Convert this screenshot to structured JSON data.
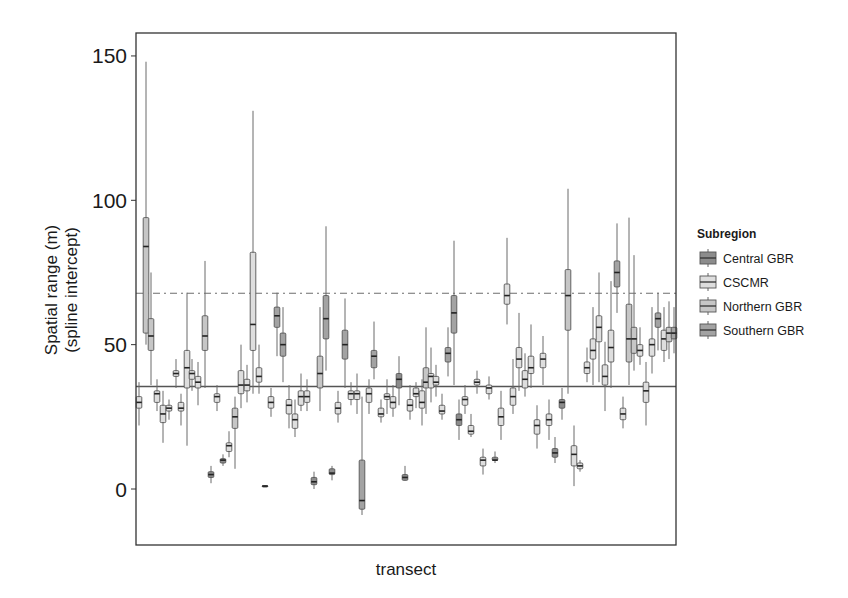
{
  "chart_data": {
    "type": "boxplot",
    "title": "",
    "xlabel": "transect",
    "ylabel": "Spatial range (m)\n(spline intercept)",
    "ylabel_lines": [
      "Spatial range (m)",
      "(spline intercept)"
    ],
    "ylim": [
      -18,
      158
    ],
    "yticks": [
      0,
      50,
      100,
      150
    ],
    "ytick_labels": [
      "0",
      "50",
      "100",
      "150"
    ],
    "xticks": [],
    "grid": false,
    "legend": {
      "title": "Subregion",
      "position": "right",
      "entries": [
        {
          "key": "central",
          "label": "Central GBR",
          "color": "#8c8c8c"
        },
        {
          "key": "cscmr",
          "label": "CSCMR",
          "color": "#dedede"
        },
        {
          "key": "northern",
          "label": "Northern GBR",
          "color": "#c6c6c6"
        },
        {
          "key": "southern",
          "label": "Southern GBR",
          "color": "#a3a3a3"
        }
      ]
    },
    "reference_lines": [
      {
        "style": "solid",
        "y": 35.5,
        "color": "#555555"
      },
      {
        "style": "dash-dot",
        "y": 67.8,
        "color": "#6e6e6e"
      }
    ],
    "boxes": [
      {
        "x": 139,
        "group": "cscmr",
        "min": 22,
        "q1": 28,
        "med": 30,
        "q3": 32,
        "max": 37
      },
      {
        "x": 146,
        "group": "northern",
        "min": 50,
        "q1": 54,
        "med": 84,
        "q3": 94,
        "max": 148
      },
      {
        "x": 151,
        "group": "northern",
        "min": 36,
        "q1": 48,
        "med": 53,
        "q3": 59,
        "max": 75
      },
      {
        "x": 157,
        "group": "cscmr",
        "min": 27,
        "q1": 30,
        "med": 33,
        "q3": 34,
        "max": 38
      },
      {
        "x": 163,
        "group": "cscmr",
        "min": 16,
        "q1": 23,
        "med": 26,
        "q3": 29,
        "max": 34
      },
      {
        "x": 169,
        "group": "cscmr",
        "min": 24,
        "q1": 27,
        "med": 28,
        "q3": 29,
        "max": 31
      },
      {
        "x": 176,
        "group": "cscmr",
        "min": 35,
        "q1": 39,
        "med": 40,
        "q3": 41,
        "max": 45
      },
      {
        "x": 181,
        "group": "cscmr",
        "min": 22,
        "q1": 27,
        "med": 28,
        "q3": 30,
        "max": 33
      },
      {
        "x": 187,
        "group": "cscmr",
        "min": 15,
        "q1": 35,
        "med": 42,
        "q3": 48,
        "max": 68
      },
      {
        "x": 192,
        "group": "cscmr",
        "min": 34,
        "q1": 38,
        "med": 40,
        "q3": 41,
        "max": 45
      },
      {
        "x": 198,
        "group": "cscmr",
        "min": 29,
        "q1": 35,
        "med": 37,
        "q3": 39,
        "max": 44
      },
      {
        "x": 205,
        "group": "northern",
        "min": 35,
        "q1": 48,
        "med": 53,
        "q3": 60,
        "max": 79
      },
      {
        "x": 217,
        "group": "cscmr",
        "min": 27,
        "q1": 30,
        "med": 32,
        "q3": 33,
        "max": 36
      },
      {
        "x": 211,
        "group": "central",
        "min": 2,
        "q1": 4,
        "med": 5,
        "q3": 6,
        "max": 8
      },
      {
        "x": 223,
        "group": "central",
        "min": 8,
        "q1": 9,
        "med": 10,
        "q3": 10.5,
        "max": 12
      },
      {
        "x": 229,
        "group": "cscmr",
        "min": 11,
        "q1": 13,
        "med": 15,
        "q3": 16,
        "max": 20
      },
      {
        "x": 235,
        "group": "northern",
        "min": 7,
        "q1": 21,
        "med": 25,
        "q3": 28,
        "max": 32
      },
      {
        "x": 241,
        "group": "cscmr",
        "min": 28,
        "q1": 33,
        "med": 36,
        "q3": 41,
        "max": 50
      },
      {
        "x": 247,
        "group": "cscmr",
        "min": 30,
        "q1": 34,
        "med": 36,
        "q3": 38,
        "max": 43
      },
      {
        "x": 253,
        "group": "cscmr",
        "min": 33,
        "q1": 48,
        "med": 57,
        "q3": 82,
        "max": 131
      },
      {
        "x": 259,
        "group": "cscmr",
        "min": 33,
        "q1": 37,
        "med": 39,
        "q3": 42,
        "max": 50
      },
      {
        "x": 265,
        "group": "central",
        "min": 0.8,
        "q1": 1,
        "med": 1,
        "q3": 1.2,
        "max": 1.3
      },
      {
        "x": 271,
        "group": "cscmr",
        "min": 25,
        "q1": 28,
        "med": 30,
        "q3": 32,
        "max": 35
      },
      {
        "x": 277,
        "group": "southern",
        "min": 46,
        "q1": 56,
        "med": 60,
        "q3": 63,
        "max": 68
      },
      {
        "x": 283,
        "group": "southern",
        "min": 37,
        "q1": 46,
        "med": 50,
        "q3": 54,
        "max": 63
      },
      {
        "x": 289,
        "group": "cscmr",
        "min": 21,
        "q1": 26,
        "med": 29,
        "q3": 31,
        "max": 36
      },
      {
        "x": 295,
        "group": "cscmr",
        "min": 18,
        "q1": 21,
        "med": 24,
        "q3": 26,
        "max": 31
      },
      {
        "x": 301,
        "group": "cscmr",
        "min": 27,
        "q1": 29,
        "med": 32,
        "q3": 34,
        "max": 40
      },
      {
        "x": 307,
        "group": "cscmr",
        "min": 27,
        "q1": 30,
        "med": 32,
        "q3": 34,
        "max": 38
      },
      {
        "x": 314,
        "group": "central",
        "min": 0,
        "q1": 1.5,
        "med": 2.5,
        "q3": 4,
        "max": 6
      },
      {
        "x": 320,
        "group": "northern",
        "min": 27,
        "q1": 35,
        "med": 40,
        "q3": 46,
        "max": 63
      },
      {
        "x": 326,
        "group": "southern",
        "min": 41,
        "q1": 52,
        "med": 59,
        "q3": 67,
        "max": 91
      },
      {
        "x": 332,
        "group": "central",
        "min": 3,
        "q1": 5,
        "med": 5.5,
        "q3": 7,
        "max": 8
      },
      {
        "x": 338,
        "group": "cscmr",
        "min": 23,
        "q1": 26,
        "med": 28,
        "q3": 30,
        "max": 34
      },
      {
        "x": 345,
        "group": "southern",
        "min": 35,
        "q1": 45,
        "med": 50,
        "q3": 55,
        "max": 66
      },
      {
        "x": 351,
        "group": "cscmr",
        "min": 29,
        "q1": 31,
        "med": 33,
        "q3": 34,
        "max": 37
      },
      {
        "x": 357,
        "group": "cscmr",
        "min": 26,
        "q1": 31,
        "med": 33,
        "q3": 34,
        "max": 40
      },
      {
        "x": 362,
        "group": "southern",
        "min": -9,
        "q1": -7,
        "med": -4,
        "q3": 10,
        "max": 32
      },
      {
        "x": 369,
        "group": "cscmr",
        "min": 26,
        "q1": 30,
        "med": 33,
        "q3": 35,
        "max": 38
      },
      {
        "x": 374,
        "group": "southern",
        "min": 38,
        "q1": 42,
        "med": 46,
        "q3": 48,
        "max": 58
      },
      {
        "x": 381,
        "group": "cscmr",
        "min": 23,
        "q1": 25,
        "med": 26,
        "q3": 28,
        "max": 31
      },
      {
        "x": 387,
        "group": "cscmr",
        "min": 26,
        "q1": 31,
        "med": 32,
        "q3": 33,
        "max": 38
      },
      {
        "x": 393,
        "group": "cscmr",
        "min": 25,
        "q1": 28,
        "med": 30,
        "q3": 32,
        "max": 36
      },
      {
        "x": 399,
        "group": "central",
        "min": 29,
        "q1": 35,
        "med": 38,
        "q3": 40,
        "max": 46
      },
      {
        "x": 405,
        "group": "central",
        "min": 3,
        "q1": 3,
        "med": 4,
        "q3": 5,
        "max": 8
      },
      {
        "x": 410,
        "group": "cscmr",
        "min": 24,
        "q1": 27,
        "med": 29,
        "q3": 31,
        "max": 36
      },
      {
        "x": 416,
        "group": "cscmr",
        "min": 28,
        "q1": 32,
        "med": 33,
        "q3": 35,
        "max": 37
      },
      {
        "x": 422,
        "group": "cscmr",
        "min": 22,
        "q1": 28,
        "med": 30,
        "q3": 34,
        "max": 38
      },
      {
        "x": 426,
        "group": "northern",
        "min": 26,
        "q1": 35,
        "med": 37,
        "q3": 42,
        "max": 56
      },
      {
        "x": 431,
        "group": "cscmr",
        "min": 30,
        "q1": 35,
        "med": 39,
        "q3": 40,
        "max": 49
      },
      {
        "x": 436,
        "group": "cscmr",
        "min": 32,
        "q1": 36,
        "med": 37,
        "q3": 39,
        "max": 43
      },
      {
        "x": 442,
        "group": "cscmr",
        "min": 24,
        "q1": 26,
        "med": 27,
        "q3": 29,
        "max": 33
      },
      {
        "x": 448,
        "group": "southern",
        "min": 39,
        "q1": 44,
        "med": 47,
        "q3": 49,
        "max": 56
      },
      {
        "x": 454,
        "group": "southern",
        "min": 36,
        "q1": 54,
        "med": 61,
        "q3": 67,
        "max": 86
      },
      {
        "x": 459,
        "group": "central",
        "min": 17,
        "q1": 22,
        "med": 24,
        "q3": 26,
        "max": 31
      },
      {
        "x": 465,
        "group": "cscmr",
        "min": 26,
        "q1": 29,
        "med": 31,
        "q3": 32,
        "max": 36
      },
      {
        "x": 471,
        "group": "cscmr",
        "min": 18,
        "q1": 19,
        "med": 20,
        "q3": 22,
        "max": 26
      },
      {
        "x": 477,
        "group": "cscmr",
        "min": 33,
        "q1": 36,
        "med": 37,
        "q3": 38,
        "max": 41
      },
      {
        "x": 483,
        "group": "cscmr",
        "min": 5,
        "q1": 8,
        "med": 10,
        "q3": 11,
        "max": 14
      },
      {
        "x": 489,
        "group": "cscmr",
        "min": 31,
        "q1": 33,
        "med": 35,
        "q3": 36,
        "max": 39
      },
      {
        "x": 495,
        "group": "central",
        "min": 9,
        "q1": 10,
        "med": 10,
        "q3": 11,
        "max": 13
      },
      {
        "x": 501,
        "group": "cscmr",
        "min": 17,
        "q1": 22,
        "med": 25,
        "q3": 28,
        "max": 34
      },
      {
        "x": 507,
        "group": "cscmr",
        "min": 57,
        "q1": 64,
        "med": 67,
        "q3": 71,
        "max": 87
      },
      {
        "x": 513,
        "group": "cscmr",
        "min": 26,
        "q1": 29,
        "med": 32,
        "q3": 35,
        "max": 45
      },
      {
        "x": 519,
        "group": "cscmr",
        "min": 34,
        "q1": 42,
        "med": 45,
        "q3": 49,
        "max": 61
      },
      {
        "x": 525,
        "group": "cscmr",
        "min": 32,
        "q1": 35,
        "med": 38,
        "q3": 41,
        "max": 47
      },
      {
        "x": 531,
        "group": "cscmr",
        "min": 35,
        "q1": 40,
        "med": 42,
        "q3": 46,
        "max": 57
      },
      {
        "x": 537,
        "group": "cscmr",
        "min": 14,
        "q1": 19,
        "med": 22,
        "q3": 24,
        "max": 29
      },
      {
        "x": 543,
        "group": "cscmr",
        "min": 36,
        "q1": 42,
        "med": 45,
        "q3": 47,
        "max": 53
      },
      {
        "x": 549,
        "group": "cscmr",
        "min": 17,
        "q1": 22,
        "med": 24,
        "q3": 26,
        "max": 31
      },
      {
        "x": 555,
        "group": "central",
        "min": 9,
        "q1": 11,
        "med": 12.5,
        "q3": 14,
        "max": 18
      },
      {
        "x": 562,
        "group": "central",
        "min": 24,
        "q1": 28,
        "med": 30,
        "q3": 31,
        "max": 35
      },
      {
        "x": 568,
        "group": "northern",
        "min": 33,
        "q1": 55,
        "med": 67,
        "q3": 76,
        "max": 104
      },
      {
        "x": 574,
        "group": "cscmr",
        "min": 1,
        "q1": 8,
        "med": 12,
        "q3": 15,
        "max": 22
      },
      {
        "x": 580,
        "group": "cscmr",
        "min": 6,
        "q1": 7,
        "med": 8,
        "q3": 9,
        "max": 10
      },
      {
        "x": 587,
        "group": "cscmr",
        "min": 37,
        "q1": 40,
        "med": 42,
        "q3": 44,
        "max": 49
      },
      {
        "x": 593,
        "group": "cscmr",
        "min": 36,
        "q1": 45,
        "med": 48,
        "q3": 52,
        "max": 63
      },
      {
        "x": 599,
        "group": "cscmr",
        "min": 37,
        "q1": 51,
        "med": 56,
        "q3": 60,
        "max": 75
      },
      {
        "x": 605,
        "group": "cscmr",
        "min": 27,
        "q1": 36,
        "med": 39,
        "q3": 43,
        "max": 51
      },
      {
        "x": 611,
        "group": "cscmr",
        "min": 35,
        "q1": 44,
        "med": 49,
        "q3": 55,
        "max": 72
      },
      {
        "x": 617,
        "group": "southern",
        "min": 61,
        "q1": 70,
        "med": 75,
        "q3": 79,
        "max": 92
      },
      {
        "x": 623,
        "group": "cscmr",
        "min": 21,
        "q1": 24,
        "med": 26,
        "q3": 28,
        "max": 32
      },
      {
        "x": 629,
        "group": "northern",
        "min": 36,
        "q1": 44,
        "med": 52,
        "q3": 64,
        "max": 94
      },
      {
        "x": 634,
        "group": "northern",
        "min": 41,
        "q1": 47,
        "med": 52,
        "q3": 56,
        "max": 81
      },
      {
        "x": 640,
        "group": "cscmr",
        "min": 43,
        "q1": 46,
        "med": 48,
        "q3": 50,
        "max": 56
      },
      {
        "x": 646,
        "group": "cscmr",
        "min": 22,
        "q1": 30,
        "med": 34,
        "q3": 37,
        "max": 44
      },
      {
        "x": 652,
        "group": "cscmr",
        "min": 40,
        "q1": 46,
        "med": 50,
        "q3": 52,
        "max": 63
      },
      {
        "x": 658,
        "group": "southern",
        "min": 48,
        "q1": 56,
        "med": 59,
        "q3": 61,
        "max": 68
      },
      {
        "x": 664,
        "group": "cscmr",
        "min": 44,
        "q1": 48,
        "med": 52,
        "q3": 55,
        "max": 63
      },
      {
        "x": 669,
        "group": "northern",
        "min": 45,
        "q1": 51,
        "med": 54,
        "q3": 56,
        "max": 65
      },
      {
        "x": 674,
        "group": "southern",
        "min": 47,
        "q1": 52,
        "med": 54,
        "q3": 56,
        "max": 63
      }
    ]
  }
}
